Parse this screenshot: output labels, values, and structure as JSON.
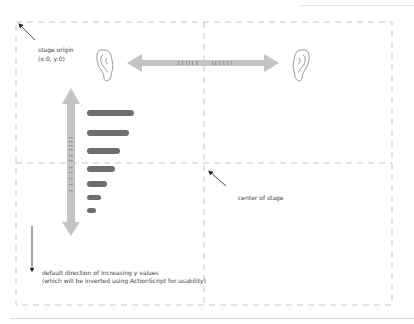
{
  "diagram": {
    "labels": {
      "stage_origin": "stage origin",
      "stage_origin_coords": "(x:0, y:0)",
      "center_of_stage": "center of stage",
      "y_direction_line1": "default direction of increasing y values",
      "y_direction_line2": "(which will be inverted using ActionScript for usability)"
    },
    "stage": {
      "left": 16,
      "top": 22,
      "right": 392,
      "bottom": 305,
      "center_x": 204,
      "center_y": 163
    },
    "colors": {
      "border": "#b8b8b8",
      "arrow_fill": "#c4c4c4",
      "bar_fill": "#6e6e6e",
      "text": "#444444"
    },
    "volume_bars_count": 7
  }
}
